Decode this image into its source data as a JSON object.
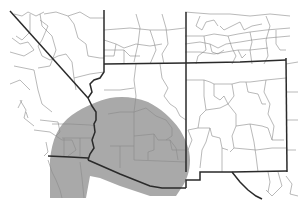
{
  "map": {
    "description": "Range map of the southwestern United States with a shaded distribution area",
    "colors": {
      "background": "#ffffff",
      "range_fill": "#a9a9a9",
      "state_border": "#2a2a2a",
      "county_border": "#8a8a8a"
    },
    "regions": [
      {
        "name": "Nevada"
      },
      {
        "name": "Utah"
      },
      {
        "name": "Colorado"
      },
      {
        "name": "California"
      },
      {
        "name": "Arizona"
      },
      {
        "name": "New Mexico"
      },
      {
        "name": "Mexico"
      }
    ],
    "range_label": "Shaded distribution range (southern Nevada, southeastern California, western and central Arizona, northwestern Mexico)"
  }
}
